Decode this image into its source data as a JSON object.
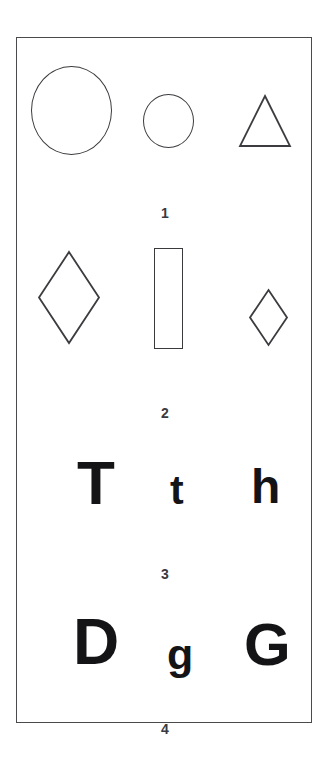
{
  "figure": {
    "background_color": "#ffffff",
    "frame_color": "#4a4a4e",
    "stroke_color": "#3c3c40",
    "glyph_color": "#141416",
    "rows": [
      {
        "label": "1",
        "items": [
          {
            "name": "circle-large",
            "kind": "circle",
            "size": "large"
          },
          {
            "name": "circle-medium",
            "kind": "circle",
            "size": "medium"
          },
          {
            "name": "triangle",
            "kind": "triangle",
            "size": "medium"
          }
        ]
      },
      {
        "label": "2",
        "items": [
          {
            "name": "diamond-large",
            "kind": "diamond",
            "size": "large"
          },
          {
            "name": "rectangle",
            "kind": "rectangle",
            "size": "tall-narrow"
          },
          {
            "name": "diamond-small",
            "kind": "diamond",
            "size": "small"
          }
        ]
      },
      {
        "label": "3",
        "items": [
          {
            "name": "glyph-T",
            "kind": "letter",
            "text": "T",
            "size": "large"
          },
          {
            "name": "glyph-t",
            "kind": "letter",
            "text": "t",
            "size": "small"
          },
          {
            "name": "glyph-h",
            "kind": "letter",
            "text": "h",
            "size": "medium"
          }
        ]
      },
      {
        "label": "4",
        "items": [
          {
            "name": "glyph-D",
            "kind": "letter",
            "text": "D",
            "size": "large"
          },
          {
            "name": "glyph-g",
            "kind": "letter",
            "text": "g",
            "size": "small"
          },
          {
            "name": "glyph-G",
            "kind": "letter",
            "text": "G",
            "size": "large"
          }
        ]
      }
    ]
  }
}
